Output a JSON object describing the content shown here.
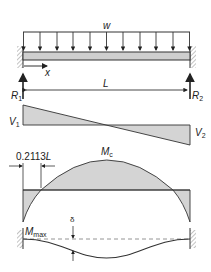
{
  "diagram": {
    "colors": {
      "line": "#333333",
      "fill": "#d4d4d4",
      "beam_fill": "#cfcfcf",
      "hatch": "#888888"
    },
    "load": {
      "label": "w",
      "arrow_count": 11
    },
    "axis": {
      "label": "x"
    },
    "span": {
      "label": "L"
    },
    "reactions": {
      "left": {
        "label": "R",
        "sub": "1"
      },
      "right": {
        "label": "R",
        "sub": "2"
      }
    },
    "shear": {
      "left": {
        "label": "V",
        "sub": "1"
      },
      "right": {
        "label": "V",
        "sub": "2"
      }
    },
    "moment": {
      "inflection_label": "0.2113",
      "inflection_label_L": "L",
      "center": {
        "label": "M",
        "sub": "c"
      },
      "end": {
        "label": "M",
        "sub": "max"
      }
    },
    "deflection": {
      "label": "δ"
    }
  }
}
